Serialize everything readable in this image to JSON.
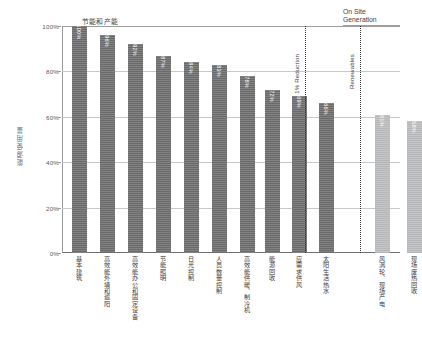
{
  "chart_data": {
    "type": "bar",
    "title": "节能和产能",
    "xlabel": "",
    "ylabel": "能源使用量",
    "ylim": [
      0,
      100
    ],
    "ytick_labels": [
      "0%",
      "20%",
      "40%",
      "60%",
      "80%",
      "100%"
    ],
    "ytick_values": [
      0,
      20,
      40,
      60,
      80,
      100
    ],
    "grid": true,
    "legend": "none",
    "categories": [
      "基本建筑",
      "高效能外墙和遮阳",
      "高效能办公和固定设备",
      "节能照明",
      "日光控制",
      "人员数量控制",
      "高效能供暖、制冷机",
      "能源回收",
      "应需求供风",
      "太阳生活热水",
      "风涡轮、现场产电",
      "现场废热回收"
    ],
    "values": [
      100,
      96,
      92,
      87,
      84,
      83,
      78,
      72,
      69,
      66,
      61,
      58
    ],
    "value_labels": [
      "100%",
      "96%",
      "92%",
      "87%",
      "84%",
      "83%",
      "78%",
      "72%",
      "69%",
      "66%",
      "61%",
      "58%"
    ],
    "bar_colors": [
      "#6a6a6a",
      "#6a6a6a",
      "#6a6a6a",
      "#6a6a6a",
      "#6a6a6a",
      "#6a6a6a",
      "#6a6a6a",
      "#6a6a6a",
      "#6a6a6a",
      "#6a6a6a",
      "#b6b7b8",
      "#b6b7b8"
    ],
    "annotations": [
      {
        "name": "section-title",
        "text": "节能和产能"
      },
      {
        "name": "divider-label",
        "text": "1% Reduction"
      },
      {
        "name": "divider-label",
        "text": "Renewables"
      },
      {
        "name": "group-header",
        "text": "On Site Generation"
      }
    ]
  },
  "chart": {
    "title": "节能和产能",
    "y_axis_label": "能源使用量",
    "y_ticks": [
      "100%",
      "80%",
      "60%",
      "40%",
      "20%",
      "0%"
    ],
    "divider_1_label": "1% Reduction",
    "divider_2_label": "Renewables",
    "onsite_line_1": "On Site",
    "onsite_line_2": "Generation"
  }
}
